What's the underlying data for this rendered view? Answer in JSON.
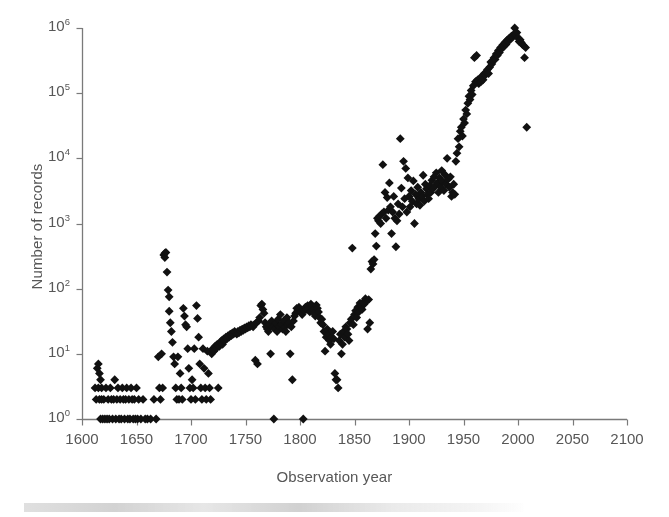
{
  "chart_data": {
    "type": "scatter",
    "title": "",
    "xlabel": "Observation year",
    "ylabel": "Number of records",
    "xlim": [
      1600,
      2100
    ],
    "ylim": [
      1,
      1000000
    ],
    "yscale": "log",
    "xscale": "linear",
    "grid": false,
    "legend": null,
    "marker": "diamond",
    "marker_color": "#111111",
    "axis_color": "#7a7a7a",
    "text_color": "#575757",
    "background_color": "#ffffff",
    "xticks": [
      1600,
      1650,
      1700,
      1750,
      1800,
      1850,
      1900,
      1950,
      2000,
      2050,
      2100
    ],
    "xtick_labels": [
      "1600",
      "1650",
      "1700",
      "1750",
      "1800",
      "1850",
      "1900",
      "1950",
      "2000",
      "2050",
      "2100"
    ],
    "yticks": [
      1,
      10,
      100,
      1000,
      10000,
      100000,
      1000000
    ],
    "ytick_labels": [
      "10<sup>0</sup>",
      "10<sup>1</sup>",
      "10<sup>2</sup>",
      "10<sup>3</sup>",
      "10<sup>4</sup>",
      "10<sup>5</sup>",
      "10<sup>6</sup>"
    ],
    "points": [
      [
        1612,
        3
      ],
      [
        1613,
        2
      ],
      [
        1614,
        6
      ],
      [
        1615,
        7
      ],
      [
        1615,
        3
      ],
      [
        1616,
        5
      ],
      [
        1616,
        2
      ],
      [
        1617,
        4
      ],
      [
        1617,
        1
      ],
      [
        1618,
        3
      ],
      [
        1618,
        2
      ],
      [
        1619,
        1
      ],
      [
        1620,
        2
      ],
      [
        1621,
        1
      ],
      [
        1622,
        3
      ],
      [
        1623,
        1
      ],
      [
        1624,
        2
      ],
      [
        1625,
        1
      ],
      [
        1626,
        3
      ],
      [
        1627,
        2
      ],
      [
        1628,
        1
      ],
      [
        1629,
        2
      ],
      [
        1630,
        4
      ],
      [
        1631,
        1
      ],
      [
        1632,
        2
      ],
      [
        1633,
        3
      ],
      [
        1634,
        1
      ],
      [
        1635,
        2
      ],
      [
        1636,
        1
      ],
      [
        1637,
        3
      ],
      [
        1638,
        2
      ],
      [
        1639,
        1
      ],
      [
        1640,
        2
      ],
      [
        1641,
        3
      ],
      [
        1642,
        1
      ],
      [
        1643,
        2
      ],
      [
        1644,
        1
      ],
      [
        1645,
        3
      ],
      [
        1646,
        2
      ],
      [
        1647,
        1
      ],
      [
        1648,
        2
      ],
      [
        1649,
        1
      ],
      [
        1650,
        3
      ],
      [
        1651,
        1
      ],
      [
        1652,
        2
      ],
      [
        1654,
        1
      ],
      [
        1656,
        2
      ],
      [
        1658,
        1
      ],
      [
        1660,
        1
      ],
      [
        1663,
        1
      ],
      [
        1666,
        2
      ],
      [
        1668,
        1
      ],
      [
        1670,
        9
      ],
      [
        1671,
        3
      ],
      [
        1672,
        2
      ],
      [
        1673,
        10
      ],
      [
        1674,
        3
      ],
      [
        1675,
        330
      ],
      [
        1676,
        350
      ],
      [
        1676,
        300
      ],
      [
        1677,
        360
      ],
      [
        1678,
        180
      ],
      [
        1679,
        95
      ],
      [
        1680,
        75
      ],
      [
        1680,
        45
      ],
      [
        1681,
        30
      ],
      [
        1682,
        22
      ],
      [
        1683,
        15
      ],
      [
        1684,
        9
      ],
      [
        1685,
        7
      ],
      [
        1686,
        3
      ],
      [
        1687,
        2
      ],
      [
        1688,
        9
      ],
      [
        1689,
        2
      ],
      [
        1690,
        5
      ],
      [
        1691,
        3
      ],
      [
        1692,
        2
      ],
      [
        1693,
        50
      ],
      [
        1694,
        38
      ],
      [
        1695,
        28
      ],
      [
        1696,
        26
      ],
      [
        1697,
        12
      ],
      [
        1698,
        6
      ],
      [
        1699,
        3
      ],
      [
        1700,
        2
      ],
      [
        1701,
        4
      ],
      [
        1702,
        3
      ],
      [
        1703,
        12
      ],
      [
        1704,
        2
      ],
      [
        1705,
        55
      ],
      [
        1706,
        35
      ],
      [
        1707,
        18
      ],
      [
        1708,
        7
      ],
      [
        1709,
        3
      ],
      [
        1710,
        2
      ],
      [
        1711,
        12
      ],
      [
        1712,
        6
      ],
      [
        1713,
        3
      ],
      [
        1714,
        2
      ],
      [
        1715,
        11
      ],
      [
        1716,
        5
      ],
      [
        1717,
        3
      ],
      [
        1718,
        2
      ],
      [
        1719,
        10
      ],
      [
        1720,
        12
      ],
      [
        1721,
        11
      ],
      [
        1722,
        13
      ],
      [
        1723,
        12
      ],
      [
        1724,
        14
      ],
      [
        1725,
        3
      ],
      [
        1726,
        13
      ],
      [
        1727,
        15
      ],
      [
        1728,
        16
      ],
      [
        1729,
        14
      ],
      [
        1730,
        17
      ],
      [
        1731,
        16
      ],
      [
        1732,
        18
      ],
      [
        1733,
        17
      ],
      [
        1734,
        19
      ],
      [
        1735,
        18
      ],
      [
        1736,
        20
      ],
      [
        1737,
        19
      ],
      [
        1738,
        21
      ],
      [
        1739,
        20
      ],
      [
        1740,
        22
      ],
      [
        1741,
        21
      ],
      [
        1742,
        20
      ],
      [
        1743,
        22
      ],
      [
        1744,
        21
      ],
      [
        1745,
        23
      ],
      [
        1746,
        22
      ],
      [
        1747,
        24
      ],
      [
        1748,
        23
      ],
      [
        1749,
        25
      ],
      [
        1750,
        24
      ],
      [
        1751,
        26
      ],
      [
        1752,
        25
      ],
      [
        1753,
        27
      ],
      [
        1754,
        26
      ],
      [
        1755,
        28
      ],
      [
        1756,
        27
      ],
      [
        1757,
        26
      ],
      [
        1758,
        28
      ],
      [
        1759,
        8
      ],
      [
        1760,
        30
      ],
      [
        1761,
        7
      ],
      [
        1762,
        32
      ],
      [
        1763,
        36
      ],
      [
        1764,
        55
      ],
      [
        1765,
        58
      ],
      [
        1766,
        48
      ],
      [
        1767,
        42
      ],
      [
        1768,
        30
      ],
      [
        1769,
        26
      ],
      [
        1770,
        24
      ],
      [
        1771,
        22
      ],
      [
        1772,
        28
      ],
      [
        1773,
        10
      ],
      [
        1774,
        32
      ],
      [
        1775,
        26
      ],
      [
        1776,
        1
      ],
      [
        1777,
        24
      ],
      [
        1778,
        30
      ],
      [
        1779,
        22
      ],
      [
        1780,
        34
      ],
      [
        1781,
        26
      ],
      [
        1782,
        40
      ],
      [
        1783,
        28
      ],
      [
        1784,
        24
      ],
      [
        1785,
        32
      ],
      [
        1786,
        26
      ],
      [
        1787,
        22
      ],
      [
        1788,
        36
      ],
      [
        1789,
        28
      ],
      [
        1790,
        30
      ],
      [
        1791,
        10
      ],
      [
        1792,
        26
      ],
      [
        1793,
        4
      ],
      [
        1794,
        32
      ],
      [
        1795,
        38
      ],
      [
        1796,
        42
      ],
      [
        1797,
        50
      ],
      [
        1798,
        46
      ],
      [
        1799,
        52
      ],
      [
        1800,
        48
      ],
      [
        1801,
        44
      ],
      [
        1802,
        40
      ],
      [
        1803,
        1
      ],
      [
        1804,
        46
      ],
      [
        1805,
        52
      ],
      [
        1806,
        48
      ],
      [
        1807,
        55
      ],
      [
        1808,
        50
      ],
      [
        1809,
        44
      ],
      [
        1810,
        58
      ],
      [
        1811,
        54
      ],
      [
        1812,
        48
      ],
      [
        1813,
        42
      ],
      [
        1814,
        38
      ],
      [
        1815,
        56
      ],
      [
        1816,
        50
      ],
      [
        1817,
        44
      ],
      [
        1818,
        36
      ],
      [
        1819,
        30
      ],
      [
        1820,
        34
      ],
      [
        1821,
        28
      ],
      [
        1822,
        22
      ],
      [
        1823,
        11
      ],
      [
        1824,
        18
      ],
      [
        1825,
        24
      ],
      [
        1826,
        20
      ],
      [
        1827,
        16
      ],
      [
        1828,
        14
      ],
      [
        1829,
        18
      ],
      [
        1830,
        22
      ],
      [
        1831,
        17
      ],
      [
        1832,
        5
      ],
      [
        1833,
        4
      ],
      [
        1834,
        4
      ],
      [
        1835,
        3
      ],
      [
        1836,
        16
      ],
      [
        1837,
        20
      ],
      [
        1838,
        10
      ],
      [
        1839,
        14
      ],
      [
        1840,
        22
      ],
      [
        1841,
        18
      ],
      [
        1842,
        26
      ],
      [
        1843,
        24
      ],
      [
        1844,
        20
      ],
      [
        1845,
        16
      ],
      [
        1846,
        30
      ],
      [
        1847,
        34
      ],
      [
        1848,
        420
      ],
      [
        1849,
        28
      ],
      [
        1850,
        40
      ],
      [
        1851,
        46
      ],
      [
        1852,
        36
      ],
      [
        1853,
        52
      ],
      [
        1854,
        44
      ],
      [
        1855,
        60
      ],
      [
        1856,
        55
      ],
      [
        1857,
        48
      ],
      [
        1858,
        62
      ],
      [
        1859,
        58
      ],
      [
        1860,
        70
      ],
      [
        1861,
        65
      ],
      [
        1862,
        24
      ],
      [
        1863,
        68
      ],
      [
        1864,
        30
      ],
      [
        1865,
        200
      ],
      [
        1866,
        260
      ],
      [
        1867,
        240
      ],
      [
        1868,
        280
      ],
      [
        1869,
        700
      ],
      [
        1870,
        450
      ],
      [
        1871,
        1200
      ],
      [
        1872,
        1100
      ],
      [
        1873,
        1300
      ],
      [
        1874,
        1000
      ],
      [
        1875,
        1400
      ],
      [
        1876,
        8000
      ],
      [
        1877,
        1500
      ],
      [
        1878,
        3000
      ],
      [
        1879,
        1200
      ],
      [
        1880,
        2500
      ],
      [
        1881,
        1600
      ],
      [
        1882,
        4200
      ],
      [
        1883,
        1800
      ],
      [
        1884,
        700
      ],
      [
        1885,
        1500
      ],
      [
        1886,
        2600
      ],
      [
        1887,
        1200
      ],
      [
        1888,
        440
      ],
      [
        1889,
        1100
      ],
      [
        1890,
        2000
      ],
      [
        1891,
        1400
      ],
      [
        1892,
        20000
      ],
      [
        1893,
        3500
      ],
      [
        1894,
        1800
      ],
      [
        1895,
        9000
      ],
      [
        1896,
        2400
      ],
      [
        1897,
        7000
      ],
      [
        1898,
        1500
      ],
      [
        1899,
        5000
      ],
      [
        1900,
        2600
      ],
      [
        1901,
        1800
      ],
      [
        1902,
        3200
      ],
      [
        1903,
        2200
      ],
      [
        1904,
        4500
      ],
      [
        1905,
        1000
      ],
      [
        1906,
        2800
      ],
      [
        1907,
        2000
      ],
      [
        1908,
        3600
      ],
      [
        1909,
        2400
      ],
      [
        1910,
        1900
      ],
      [
        1911,
        3000
      ],
      [
        1912,
        2600
      ],
      [
        1913,
        5500
      ],
      [
        1914,
        2200
      ],
      [
        1915,
        4000
      ],
      [
        1916,
        3400
      ],
      [
        1917,
        2800
      ],
      [
        1918,
        2400
      ],
      [
        1919,
        3800
      ],
      [
        1920,
        3000
      ],
      [
        1921,
        4600
      ],
      [
        1922,
        3400
      ],
      [
        1923,
        5200
      ],
      [
        1924,
        3800
      ],
      [
        1925,
        6000
      ],
      [
        1926,
        4200
      ],
      [
        1927,
        3000
      ],
      [
        1928,
        5000
      ],
      [
        1929,
        3600
      ],
      [
        1930,
        6500
      ],
      [
        1931,
        4400
      ],
      [
        1932,
        3200
      ],
      [
        1933,
        5600
      ],
      [
        1934,
        4000
      ],
      [
        1935,
        10000
      ],
      [
        1936,
        4800
      ],
      [
        1937,
        3600
      ],
      [
        1938,
        5200
      ],
      [
        1939,
        2600
      ],
      [
        1940,
        3000
      ],
      [
        1941,
        4000
      ],
      [
        1942,
        2800
      ],
      [
        1943,
        9000
      ],
      [
        1944,
        12000
      ],
      [
        1945,
        20000
      ],
      [
        1946,
        15000
      ],
      [
        1947,
        26000
      ],
      [
        1948,
        30000
      ],
      [
        1949,
        22000
      ],
      [
        1950,
        40000
      ],
      [
        1951,
        35000
      ],
      [
        1952,
        55000
      ],
      [
        1953,
        48000
      ],
      [
        1954,
        70000
      ],
      [
        1955,
        90000
      ],
      [
        1956,
        80000
      ],
      [
        1957,
        110000
      ],
      [
        1958,
        95000
      ],
      [
        1959,
        130000
      ],
      [
        1960,
        350000
      ],
      [
        1961,
        150000
      ],
      [
        1962,
        380000
      ],
      [
        1963,
        160000
      ],
      [
        1964,
        140000
      ],
      [
        1965,
        170000
      ],
      [
        1966,
        150000
      ],
      [
        1967,
        180000
      ],
      [
        1968,
        160000
      ],
      [
        1969,
        200000
      ],
      [
        1970,
        190000
      ],
      [
        1971,
        210000
      ],
      [
        1972,
        230000
      ],
      [
        1973,
        200000
      ],
      [
        1974,
        250000
      ],
      [
        1975,
        300000
      ],
      [
        1976,
        280000
      ],
      [
        1977,
        320000
      ],
      [
        1978,
        350000
      ],
      [
        1979,
        330000
      ],
      [
        1980,
        400000
      ],
      [
        1981,
        380000
      ],
      [
        1982,
        450000
      ],
      [
        1983,
        420000
      ],
      [
        1984,
        500000
      ],
      [
        1985,
        480000
      ],
      [
        1986,
        550000
      ],
      [
        1987,
        520000
      ],
      [
        1988,
        600000
      ],
      [
        1989,
        560000
      ],
      [
        1990,
        650000
      ],
      [
        1991,
        620000
      ],
      [
        1992,
        700000
      ],
      [
        1993,
        680000
      ],
      [
        1994,
        750000
      ],
      [
        1995,
        720000
      ],
      [
        1996,
        800000
      ],
      [
        1997,
        1000000
      ],
      [
        1998,
        780000
      ],
      [
        1999,
        850000
      ],
      [
        2000,
        700000
      ],
      [
        2001,
        620000
      ],
      [
        2002,
        660000
      ],
      [
        2003,
        600000
      ],
      [
        2004,
        560000
      ],
      [
        2005,
        540000
      ],
      [
        2006,
        350000
      ],
      [
        2007,
        500000
      ],
      [
        2008,
        30000
      ]
    ]
  }
}
